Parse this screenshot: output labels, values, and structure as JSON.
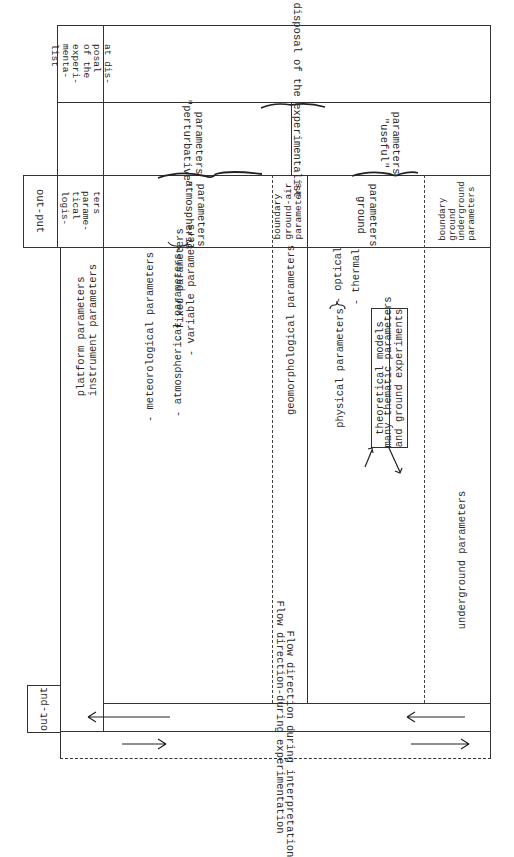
{
  "header_strip": {
    "left_cell_lines": [
      "at dis-",
      "posal",
      "of the",
      "experi-",
      "menta-",
      "list"
    ],
    "right_cell": "Not at disposal of the experimentalist"
  },
  "perturbative_strip": {
    "perturbative_line1": "\"perturbative\"",
    "perturbative_line2": "parameters",
    "useful_line1": "\"useful\"",
    "useful_line2": "parameters"
  },
  "labels_strip": {
    "output_box": "out-put",
    "logistical_lines": [
      "logis-",
      "tical",
      "parame-",
      "ters"
    ],
    "atmospheric_line1": "atmospheric",
    "atmospheric_line2": "parameters",
    "boundary_air_lines": [
      "boundary",
      "ground-air",
      "parameters"
    ],
    "ground_line1": "ground",
    "ground_line2": "parameters",
    "boundary_underground_lines": [
      "boundary",
      "ground",
      "underground",
      "parameters"
    ]
  },
  "body": {
    "platform": "platform parameters",
    "instrument": "instrument parameters",
    "meteorological": "- meteorological parameters",
    "atmospherical": "- atmospherical parameters",
    "fixed": "- fixed parameters",
    "variable": "- variable parameters",
    "geomorphological": "geomorphological parameters",
    "physical": "physical parameters",
    "optical": "- optical",
    "thermal": "- thermal",
    "thematic": "many thematic parameters",
    "theoretical": "theoretical models",
    "ground_experiments": "and ground experiments",
    "underground": "underground parameters"
  },
  "flow": {
    "output_box": "out-put",
    "experimentation": "Flow direction-during experimentation",
    "interpretation": "Flow direction during interpretation"
  }
}
